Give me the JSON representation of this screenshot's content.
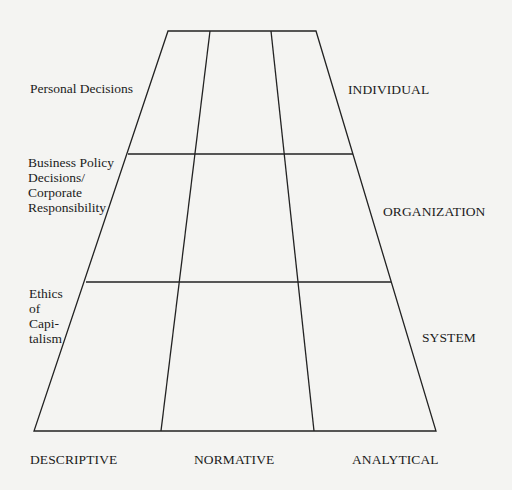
{
  "diagram": {
    "type": "trapezoid-grid",
    "rows": [
      "INDIVIDUAL",
      "ORGANIZATION",
      "SYSTEM"
    ],
    "columns": [
      "DESCRIPTIVE",
      "NORMATIVE",
      "ANALYTICAL"
    ],
    "row_descriptions": [
      {
        "lines": [
          "Personal Decisions"
        ]
      },
      {
        "lines": [
          "Business Policy",
          "Decisions/",
          "Corporate",
          "Responsibility"
        ]
      },
      {
        "lines": [
          "Ethics",
          "of",
          "Capi-",
          "talism"
        ]
      }
    ],
    "colors": {
      "line": "#222222",
      "background": "#f4f4f2",
      "text": "#1b1b1b"
    }
  }
}
